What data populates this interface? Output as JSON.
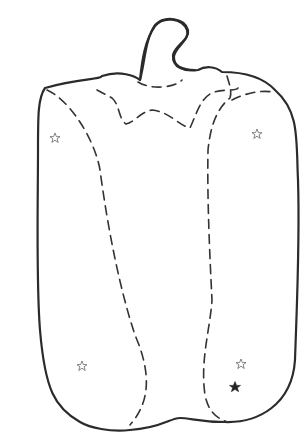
{
  "image": {
    "subject": "bell pepper line drawing",
    "background_color": "#ffffff",
    "outline_color": "#2b2b2b"
  },
  "stars": [
    {
      "id": "star-upper-left",
      "style": "hollow",
      "cx": 55,
      "cy": 138,
      "r": 5
    },
    {
      "id": "star-upper-right",
      "style": "hollow",
      "cx": 257,
      "cy": 134,
      "r": 5
    },
    {
      "id": "star-lower-left",
      "style": "hollow",
      "cx": 82,
      "cy": 366,
      "r": 5
    },
    {
      "id": "star-lower-right",
      "style": "hollow",
      "cx": 241,
      "cy": 364,
      "r": 5
    },
    {
      "id": "star-filled",
      "style": "filled",
      "cx": 235,
      "cy": 387,
      "r": 5.5
    }
  ]
}
